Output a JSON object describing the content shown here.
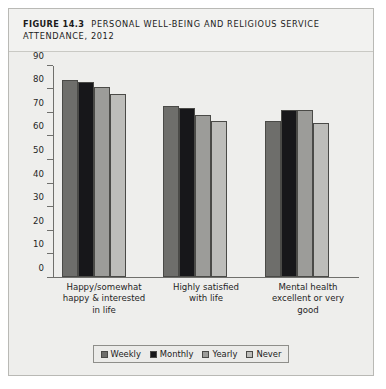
{
  "figure": {
    "label": "FIGURE 14.3",
    "title": "PERSONAL WELL-BEING AND RELIGIOUS SERVICE ATTENDANCE, 2012"
  },
  "chart_data": {
    "type": "bar",
    "title": "PERSONAL WELL-BEING AND RELIGIOUS SERVICE ATTENDANCE, 2012",
    "xlabel": "",
    "ylabel": "",
    "ylim": [
      0,
      90
    ],
    "yticks": [
      0,
      10,
      20,
      30,
      40,
      50,
      60,
      70,
      80,
      90
    ],
    "grid": false,
    "legend_position": "bottom",
    "categories": [
      "Happy/somewhat happy & interested in life",
      "Highly satisfied with life",
      "Mental health excellent or very good"
    ],
    "category_lines": [
      [
        "Happy/somewhat",
        "happy & interested",
        "in life"
      ],
      [
        "Highly satisfied",
        "with life"
      ],
      [
        "Mental health",
        "excellent or very",
        "good"
      ]
    ],
    "series": [
      {
        "name": "Weekly",
        "color": "#6e6e6b",
        "values": [
          84,
          73,
          66.5
        ]
      },
      {
        "name": "Monthly",
        "color": "#17171a",
        "values": [
          83,
          72,
          71
        ]
      },
      {
        "name": "Yearly",
        "color": "#9c9c99",
        "values": [
          81,
          69,
          71
        ]
      },
      {
        "name": "Never",
        "color": "#bdbdba",
        "values": [
          78,
          66.5,
          65.5
        ]
      }
    ]
  }
}
